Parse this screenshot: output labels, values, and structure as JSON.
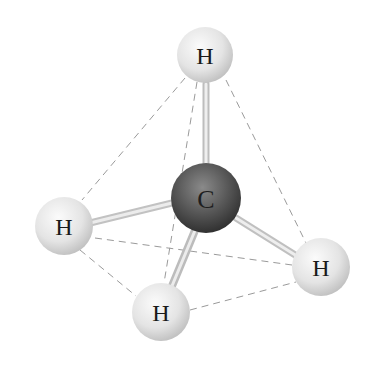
{
  "diagram": {
    "center_atom": {
      "label": "C",
      "x": 206,
      "y": 198,
      "r": 35,
      "color": "#555555"
    },
    "hydrogens": [
      {
        "id": "top",
        "label": "H",
        "x": 205,
        "y": 55,
        "r": 28
      },
      {
        "id": "left",
        "label": "H",
        "x": 64,
        "y": 226,
        "r": 29
      },
      {
        "id": "bottom",
        "label": "H",
        "x": 161,
        "y": 312,
        "r": 29
      },
      {
        "id": "right",
        "label": "H",
        "x": 321,
        "y": 267,
        "r": 29
      }
    ],
    "dashed_edges": [
      [
        "top",
        "left"
      ],
      [
        "top",
        "right"
      ],
      [
        "top",
        "bottom"
      ],
      [
        "left",
        "right"
      ],
      [
        "left",
        "bottom"
      ],
      [
        "bottom",
        "right"
      ]
    ],
    "colors": {
      "hydrogen": "#e6e6e6",
      "carbon": "#4a4a4a",
      "bond": "#d8d8d8",
      "dash": "#9a9a9a"
    }
  }
}
